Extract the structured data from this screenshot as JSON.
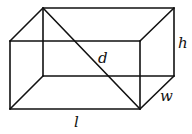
{
  "diagram": {
    "type": "rectangular-prism",
    "labels": {
      "height": "h",
      "diagonal": "d",
      "width": "w",
      "length": "l"
    },
    "colors": {
      "stroke": "#111111",
      "background": "#ffffff"
    }
  }
}
